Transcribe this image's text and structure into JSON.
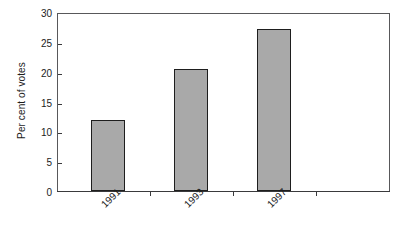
{
  "chart_data": {
    "type": "bar",
    "title": "",
    "subtitle": "",
    "xlabel": "",
    "ylabel": "Per cent of votes",
    "categories": [
      "1991",
      "1993",
      "1997"
    ],
    "values": [
      11.9,
      20.4,
      27.2
    ],
    "ylim": [
      0,
      30
    ],
    "ytick_labels": [
      "0",
      "5",
      "10",
      "15",
      "20",
      "25",
      "30"
    ],
    "ytick_values": [
      0,
      5,
      10,
      15,
      20,
      25,
      30
    ],
    "grid": false,
    "legend": null,
    "legend_position": "none",
    "bar_fill_color": "#a9a9a9",
    "bar_edge_color": "#1e1e1e",
    "axis_color": "#3a3a3c",
    "frame_color": "#58585a",
    "background_color": "#ffffff",
    "xtick_label_rotation": -45,
    "annotations": []
  }
}
